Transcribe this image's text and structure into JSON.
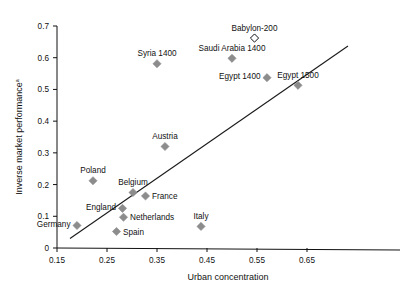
{
  "chart_data": {
    "type": "scatter",
    "title": "",
    "xlabel": "Urban concentration",
    "ylabel": "Inverse market performance",
    "ylabel_superscript": "a",
    "xlim": [
      0.15,
      0.7
    ],
    "ylim": [
      0.0,
      0.7
    ],
    "xticks": [
      "0.15",
      "0.25",
      "0.35",
      "0.45",
      "0.55",
      "0.65"
    ],
    "xtick_values": [
      0.15,
      0.25,
      0.35,
      0.45,
      0.55,
      0.65
    ],
    "yticks": [
      "0",
      "0.1",
      "0.2",
      "0.3",
      "0.4",
      "0.5",
      "0.6",
      "0.7"
    ],
    "ytick_values": [
      0,
      0.1,
      0.2,
      0.3,
      0.4,
      0.5,
      0.6,
      0.7
    ],
    "grid": false,
    "legend": "none",
    "marker_color": "#8c8c8c",
    "line_color": "#1a1a1a",
    "points": [
      {
        "label": "Germany",
        "x": 0.19,
        "y": 0.071,
        "marker": "filled-diamond",
        "label_pos": "left"
      },
      {
        "label": "Poland",
        "x": 0.222,
        "y": 0.212,
        "marker": "filled-diamond",
        "label_pos": "above"
      },
      {
        "label": "Spain",
        "x": 0.269,
        "y": 0.052,
        "marker": "filled-diamond",
        "label_pos": "right"
      },
      {
        "label": "England",
        "x": 0.281,
        "y": 0.125,
        "marker": "filled-diamond",
        "label_pos": "left"
      },
      {
        "label": "Netherlands",
        "x": 0.283,
        "y": 0.097,
        "marker": "filled-diamond",
        "label_pos": "right"
      },
      {
        "label": "Belgium",
        "x": 0.302,
        "y": 0.175,
        "marker": "filled-diamond",
        "label_pos": "above"
      },
      {
        "label": "France",
        "x": 0.327,
        "y": 0.164,
        "marker": "filled-diamond",
        "label_pos": "right"
      },
      {
        "label": "Syria 1400",
        "x": 0.35,
        "y": 0.581,
        "marker": "filled-diamond",
        "label_pos": "above"
      },
      {
        "label": "Austria",
        "x": 0.366,
        "y": 0.32,
        "marker": "filled-diamond",
        "label_pos": "above"
      },
      {
        "label": "Italy",
        "x": 0.438,
        "y": 0.068,
        "marker": "filled-diamond",
        "label_pos": "above"
      },
      {
        "label": "Saudi Arabia 1400",
        "x": 0.5,
        "y": 0.598,
        "marker": "filled-diamond",
        "label_pos": "above"
      },
      {
        "label": "Babylon-200",
        "x": 0.545,
        "y": 0.662,
        "marker": "open-diamond",
        "label_pos": "above"
      },
      {
        "label": "Egypt 1400",
        "x": 0.57,
        "y": 0.537,
        "marker": "filled-diamond",
        "label_pos": "left"
      },
      {
        "label": "Egypt 1500",
        "x": 0.632,
        "y": 0.513,
        "marker": "filled-diamond",
        "label_pos": "above"
      }
    ],
    "trendline": {
      "x0": 0.176,
      "y0": 0.03,
      "x1": 0.732,
      "y1": 0.637
    }
  }
}
